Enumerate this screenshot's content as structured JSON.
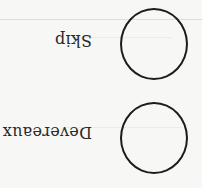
{
  "document": {
    "type": "ballot-fragment",
    "orientation": "upside-down",
    "options": [
      {
        "label": "Skip",
        "marked": false,
        "bubble_icon": "empty-oval"
      },
      {
        "label": "Devereaux",
        "marked": false,
        "bubble_icon": "empty-oval"
      }
    ]
  },
  "colors": {
    "paper": "#f7f7f5",
    "ink": "#1c1c1c",
    "text": "#2a2a2a"
  }
}
